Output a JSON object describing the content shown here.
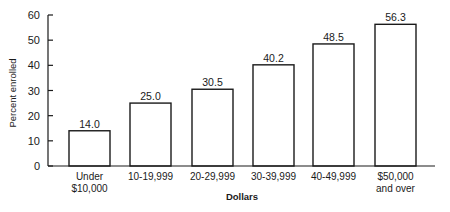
{
  "chart_data": {
    "type": "bar",
    "title": "",
    "xlabel": "Dollars",
    "ylabel": "Percent enrolled",
    "ylim": [
      0,
      60
    ],
    "yticks": [
      0,
      10,
      20,
      30,
      40,
      50,
      60
    ],
    "grid": false,
    "legend": null,
    "categories": [
      [
        "Under",
        "$10,000"
      ],
      [
        "10-19,999"
      ],
      [
        "20-29,999"
      ],
      [
        "30-39,999"
      ],
      [
        "40-49,999"
      ],
      [
        "$50,000",
        "and over"
      ]
    ],
    "values": [
      14.0,
      25.0,
      30.5,
      40.2,
      48.5,
      56.3
    ],
    "value_labels": [
      "14.0",
      "25.0",
      "30.5",
      "40.2",
      "48.5",
      "56.3"
    ]
  },
  "colors": {
    "bar_fill": "#ffffff",
    "bar_stroke": "#1a1a1a",
    "axis": "#1a1a1a"
  }
}
